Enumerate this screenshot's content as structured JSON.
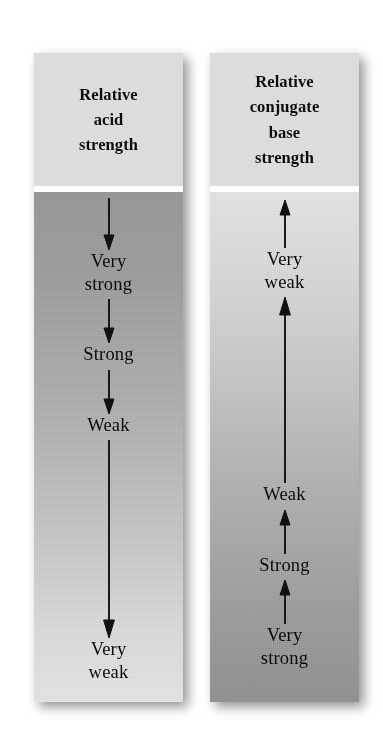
{
  "figure": {
    "background_color": "#ffffff",
    "panel_header_color": "#dcdcdc",
    "ink_color": "#111111",
    "left_gradient": {
      "top": "#969696",
      "bottom": "#e4e4e4"
    },
    "right_gradient": {
      "top": "#e3e3e3",
      "bottom": "#909090"
    }
  },
  "panels": [
    {
      "id": "relative-acid-strength",
      "header": "Relative\nacid\nstrength",
      "arrow_direction": "down",
      "scale_top_label": "Very strong",
      "scale_bottom_label": "Very weak",
      "steps": [
        {
          "label": "Very\nstrong",
          "arrow_before": "down-arrow-short"
        },
        {
          "label": "Strong",
          "arrow_before": "down-arrow-short"
        },
        {
          "label": "Weak",
          "arrow_before": "down-arrow-short"
        },
        {
          "label": "Very\nweak",
          "arrow_before": "down-arrow-long"
        }
      ]
    },
    {
      "id": "relative-conjugate-base-strength",
      "header": "Relative\nconjugate\nbase\nstrength",
      "arrow_direction": "up",
      "scale_top_label": "Very weak",
      "scale_bottom_label": "Very strong",
      "steps": [
        {
          "label": "Very\nweak",
          "arrow_before": "up-arrow-short"
        },
        {
          "label": "Weak",
          "arrow_before": "up-arrow-long"
        },
        {
          "label": "Strong",
          "arrow_before": "up-arrow-short"
        },
        {
          "label": "Very\nstrong",
          "arrow_before": "up-arrow-short"
        }
      ]
    }
  ]
}
